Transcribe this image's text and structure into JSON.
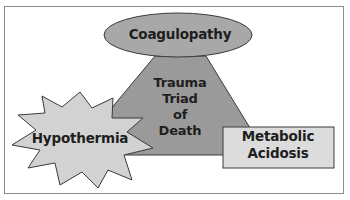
{
  "diagram": {
    "title": "Trauma Triad of Death",
    "center": {
      "lines": [
        "Trauma",
        "Triad",
        "of",
        "Death"
      ],
      "shape": "triangle"
    },
    "nodes": [
      {
        "id": "coagulopathy",
        "label": "Coagulopathy",
        "shape": "ellipse",
        "position": "top"
      },
      {
        "id": "hypothermia",
        "label": "Hypothermia",
        "shape": "starburst",
        "position": "bottom-left"
      },
      {
        "id": "metabolic-acidosis",
        "lines": [
          "Metabolic",
          "Acidosis"
        ],
        "shape": "rectangle",
        "position": "bottom-right"
      }
    ],
    "colors": {
      "triangle": "#9a9a9a",
      "ellipse": "#a8a8a8",
      "star": "#d2d2d2",
      "rectangle": "#dcdcdc",
      "outline": "#3a3a3a",
      "text": "#1e1e1e",
      "frame": "#8c8c8c"
    }
  }
}
